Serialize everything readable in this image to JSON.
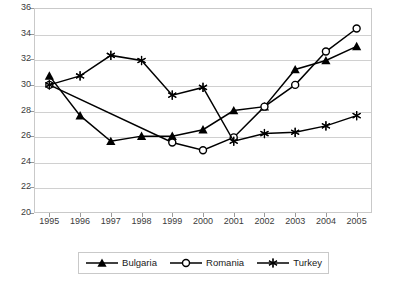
{
  "chart_data": {
    "type": "line",
    "title": "",
    "xlabel": "",
    "ylabel": "",
    "grid": true,
    "legend_position": "bottom",
    "categories": [
      "1995",
      "1996",
      "1997",
      "1998",
      "1999",
      "2000",
      "2001",
      "2002",
      "2003",
      "2004",
      "2005"
    ],
    "xlim": [
      1995,
      2005
    ],
    "ylim": [
      20,
      36
    ],
    "ytick_step": 2,
    "yticks": [
      20,
      22,
      24,
      26,
      28,
      30,
      32,
      34,
      36
    ],
    "series": [
      {
        "name": "Bulgaria",
        "marker": "filled-triangle",
        "x": [
          "1995",
          "1996",
          "1997",
          "1998",
          "1999",
          "2000",
          "2001",
          "2002",
          "2003",
          "2004",
          "2005"
        ],
        "values": [
          30.7,
          27.6,
          25.6,
          26.0,
          26.0,
          26.5,
          28.0,
          28.3,
          31.2,
          31.9,
          33.0
        ]
      },
      {
        "name": "Romania",
        "marker": "open-circle",
        "x": [
          "1995",
          "1999",
          "2000",
          "2001",
          "2002",
          "2003",
          "2004",
          "2005"
        ],
        "values": [
          30.0,
          25.5,
          24.9,
          25.9,
          28.3,
          30.0,
          32.6,
          34.4
        ]
      },
      {
        "name": "Turkey",
        "marker": "asterisk",
        "x": [
          "1995",
          "1996",
          "1997",
          "1998",
          "1999",
          "2000",
          "2001",
          "2002",
          "2003",
          "2004",
          "2005"
        ],
        "values": [
          30.0,
          30.7,
          32.3,
          31.9,
          29.2,
          29.8,
          25.6,
          26.2,
          26.3,
          26.8,
          27.6
        ]
      }
    ]
  },
  "legend": {
    "items": [
      {
        "label": "Bulgaria",
        "marker": "filled-triangle"
      },
      {
        "label": "Romania",
        "marker": "open-circle"
      },
      {
        "label": "Turkey",
        "marker": "asterisk"
      }
    ]
  },
  "colors": {
    "series_line": "#000000",
    "grid": "#d0d0d0",
    "frame": "#c9c9c9",
    "tick_text": "#3b3b3b",
    "background": "#ffffff"
  }
}
